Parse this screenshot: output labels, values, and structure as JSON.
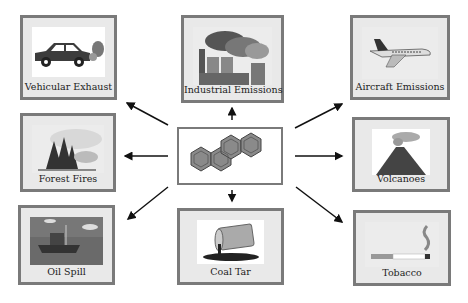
{
  "diagram": {
    "center": {
      "name": "Polycyclic aromatic hydrocarbon (chrysene) structure",
      "icon": "molecule-icon"
    },
    "sources": [
      {
        "label": "Vehicular Exhaust",
        "icon": "car-exhaust-icon"
      },
      {
        "label": "Industrial Emissions",
        "icon": "factory-smoke-icon"
      },
      {
        "label": "Aircraft Emissions",
        "icon": "airplane-icon"
      },
      {
        "label": "Forest Fires",
        "icon": "forest-fire-icon"
      },
      {
        "label": "Volcanoes",
        "icon": "volcano-icon"
      },
      {
        "label": "Oil Spill",
        "icon": "oil-ship-icon"
      },
      {
        "label": "Coal Tar",
        "icon": "barrel-spill-icon"
      },
      {
        "label": "Tobacco",
        "icon": "cigarette-icon"
      }
    ],
    "colors": {
      "border": "#7a7a7a",
      "box_fill": "#e9e9e9",
      "arrow": "#111111",
      "molecule": "#7d7d7d"
    }
  }
}
